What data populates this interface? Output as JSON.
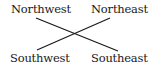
{
  "diagram": {
    "type": "compass-cross",
    "labels": {
      "northwest": "Northwest",
      "northeast": "Northeast",
      "southwest": "Southwest",
      "southeast": "Southeast"
    },
    "lines": [
      {
        "from": "Northwest",
        "to": "Southeast"
      },
      {
        "from": "Northeast",
        "to": "Southwest"
      }
    ],
    "colors": {
      "line": "#1a1a1a",
      "text": "#1a1a1a",
      "background": "#ffffff"
    }
  }
}
